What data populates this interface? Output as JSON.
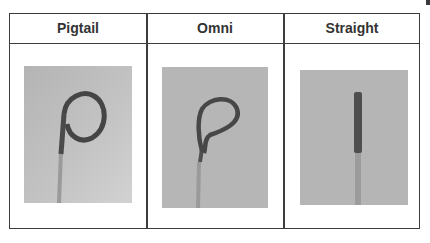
{
  "table": {
    "columns": [
      {
        "header": "Pigtail",
        "image": "pigtail-catheter-photo"
      },
      {
        "header": "Omni",
        "image": "omni-catheter-photo"
      },
      {
        "header": "Straight",
        "image": "straight-catheter-photo"
      }
    ]
  },
  "colors": {
    "border": "#3c3c3c",
    "header_text": "#333333",
    "photo_background": "#b8b8b8",
    "catheter": "#4a4a4a"
  }
}
